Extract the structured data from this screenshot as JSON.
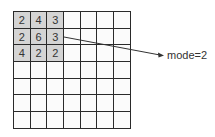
{
  "diagram": {
    "grid_size": [
      7,
      7
    ],
    "window": {
      "rows": [
        [
          "2",
          "4",
          "3"
        ],
        [
          "2",
          "6",
          "3"
        ],
        [
          "4",
          "2",
          "2"
        ]
      ],
      "highlight_color": "#d4d4d4"
    },
    "result_label": "mode=2"
  }
}
